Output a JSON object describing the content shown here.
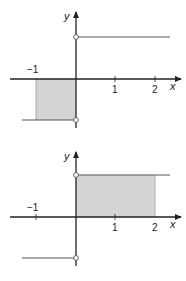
{
  "colors": {
    "axis": "#222222",
    "step_line": "#555555",
    "shade": "#d4d4d4",
    "background": "#ffffff"
  },
  "graphs": [
    {
      "name": "top-graph",
      "axis_x_label": "x",
      "axis_y_label": "y",
      "tick_labels": [
        "−1",
        "1",
        "2"
      ],
      "function": "step: -c for x<0, +c for x>0, open circles at x=0",
      "shaded_region": "x from -1 to 0, below x-axis"
    },
    {
      "name": "bottom-graph",
      "axis_x_label": "x",
      "axis_y_label": "y",
      "tick_labels": [
        "−1",
        "1",
        "2"
      ],
      "function": "step: -c for x<0, +c for x>0, open circles at x=0",
      "shaded_region": "x from 0 to 2, above x-axis"
    }
  ]
}
